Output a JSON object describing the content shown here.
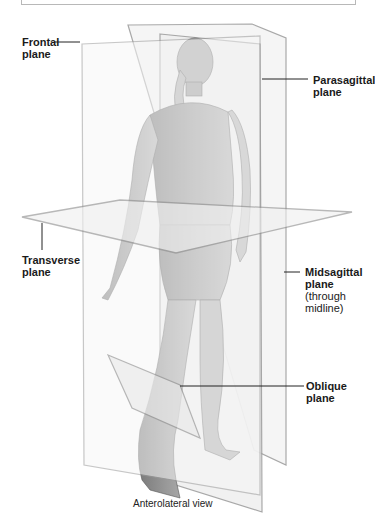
{
  "figure": {
    "caption": "Anterolateral view",
    "labels": {
      "frontal": {
        "line1": "Frontal",
        "line2": "plane"
      },
      "parasagittal": {
        "line1": "Parasagittal",
        "line2": "plane"
      },
      "transverse": {
        "line1": "Transverse",
        "line2": "plane"
      },
      "midsagittal": {
        "line1": "Midsagittal",
        "line2": "plane",
        "note1": "(through",
        "note2": "midline)"
      },
      "oblique": {
        "line1": "Oblique",
        "line2": "plane"
      }
    },
    "colors": {
      "plane_fill": "#f2f2f2",
      "plane_edge": "#9a9a9a",
      "skin": "#8c8c8c",
      "leader_line": "#222222"
    }
  }
}
